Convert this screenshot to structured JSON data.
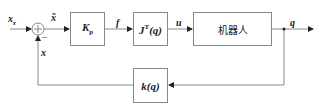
{
  "diagram": {
    "type": "block-diagram",
    "signals": {
      "reference": "x",
      "reference_sub": "r",
      "error": "x̃",
      "force": "f",
      "torque": "u",
      "output": "q",
      "feedback": "x",
      "minus_sign": "−"
    },
    "blocks": {
      "gain": {
        "main": "K",
        "sub": "p"
      },
      "jacobian": {
        "main": "J",
        "sup": "T",
        "arg": "(q)"
      },
      "robot": {
        "label": "机器人"
      },
      "kinematics": {
        "label": "k(q)"
      }
    }
  }
}
